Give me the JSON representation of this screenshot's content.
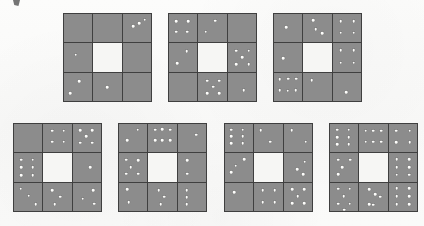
{
  "page": {
    "background_color": "#fbfbfa",
    "tile_color": "#8c8c8c",
    "grid_line_color": "#3f3f3f",
    "dot_color": "#fdfdfb",
    "center_color": "#f6f6f4",
    "artifact_label": "scan-mark"
  },
  "puzzle": {
    "type": "dot-pattern-matrix",
    "grid_count": 7,
    "grid_shape": "3x3",
    "center_cell": "blank"
  },
  "chart_data": {
    "type": "heatmap",
    "title": "",
    "xlabel": "",
    "ylabel": "",
    "categories": [
      "top-left",
      "top-middle",
      "top-right",
      "middle-left",
      "center",
      "middle-right",
      "bottom-left",
      "bottom-middle",
      "bottom-right"
    ],
    "series": [
      {
        "name": "grid-1",
        "values": [
          0,
          0,
          3,
          1,
          null,
          0,
          2,
          1,
          0
        ]
      },
      {
        "name": "grid-2",
        "values": [
          4,
          2,
          0,
          2,
          null,
          5,
          0,
          5,
          1
        ]
      },
      {
        "name": "grid-3",
        "values": [
          1,
          3,
          4,
          1,
          null,
          4,
          6,
          1,
          1
        ]
      },
      {
        "name": "grid-4",
        "values": [
          0,
          4,
          5,
          6,
          null,
          1,
          3,
          3,
          3
        ]
      },
      {
        "name": "grid-5",
        "values": [
          2,
          6,
          1,
          4,
          null,
          2,
          2,
          3,
          3
        ]
      },
      {
        "name": "grid-6",
        "values": [
          6,
          2,
          2,
          3,
          null,
          3,
          1,
          4,
          5
        ]
      },
      {
        "name": "grid-7",
        "values": [
          6,
          6,
          4,
          4,
          null,
          6,
          6,
          5,
          6
        ]
      }
    ]
  },
  "grids": [
    {
      "id": "grid-1",
      "x": 63,
      "y": 13,
      "size": 89,
      "cells": [
        {
          "name": "top-left",
          "dots": []
        },
        {
          "name": "top-middle",
          "dots": []
        },
        {
          "name": "top-right",
          "dots": [
            [
              78,
              20
            ],
            [
              58,
              32
            ],
            [
              38,
              44
            ]
          ]
        },
        {
          "name": "middle-left",
          "dots": [
            [
              42,
              40
            ]
          ]
        },
        {
          "name": "center",
          "dots": [],
          "blank": true
        },
        {
          "name": "middle-right",
          "dots": []
        },
        {
          "name": "bottom-left",
          "dots": [
            [
              54,
              30
            ],
            [
              22,
              72
            ]
          ]
        },
        {
          "name": "bottom-middle",
          "dots": [
            [
              48,
              52
            ]
          ]
        },
        {
          "name": "bottom-right",
          "dots": []
        }
      ]
    },
    {
      "id": "grid-2",
      "x": 168,
      "y": 13,
      "size": 89,
      "cells": [
        {
          "name": "top-left",
          "dots": [
            [
              26,
              26
            ],
            [
              68,
              26
            ],
            [
              26,
              62
            ],
            [
              64,
              62
            ]
          ]
        },
        {
          "name": "top-middle",
          "dots": [
            [
              60,
              24
            ],
            [
              26,
              62
            ]
          ]
        },
        {
          "name": "top-right",
          "dots": []
        },
        {
          "name": "middle-left",
          "dots": [
            [
              62,
              28
            ],
            [
              28,
              70
            ]
          ]
        },
        {
          "name": "center",
          "dots": [],
          "blank": true
        },
        {
          "name": "middle-right",
          "dots": [
            [
              30,
              26
            ],
            [
              74,
              26
            ],
            [
              52,
              50
            ],
            [
              30,
              74
            ],
            [
              74,
              74
            ]
          ]
        },
        {
          "name": "bottom-left",
          "dots": []
        },
        {
          "name": "bottom-middle",
          "dots": [
            [
              32,
              28
            ],
            [
              74,
              28
            ],
            [
              52,
              50
            ],
            [
              32,
              72
            ],
            [
              74,
              72
            ]
          ]
        },
        {
          "name": "bottom-right",
          "dots": [
            [
              56,
              62
            ]
          ]
        }
      ]
    },
    {
      "id": "grid-3",
      "x": 273,
      "y": 13,
      "size": 89,
      "cells": [
        {
          "name": "top-left",
          "dots": [
            [
              44,
              46
            ]
          ]
        },
        {
          "name": "top-middle",
          "dots": [
            [
              34,
              22
            ],
            [
              44,
              54
            ],
            [
              66,
              68
            ]
          ]
        },
        {
          "name": "top-right",
          "dots": [
            [
              28,
              26
            ],
            [
              74,
              26
            ],
            [
              28,
              66
            ],
            [
              74,
              66
            ]
          ]
        },
        {
          "name": "middle-left",
          "dots": [
            [
              32,
              52
            ]
          ]
        },
        {
          "name": "center",
          "dots": [],
          "blank": true
        },
        {
          "name": "middle-right",
          "dots": [
            [
              28,
              24
            ],
            [
              74,
              24
            ],
            [
              28,
              68
            ],
            [
              74,
              68
            ]
          ]
        },
        {
          "name": "bottom-left",
          "dots": [
            [
              20,
              24
            ],
            [
              50,
              22
            ],
            [
              78,
              22
            ],
            [
              20,
              62
            ],
            [
              48,
              64
            ],
            [
              76,
              62
            ]
          ]
        },
        {
          "name": "bottom-middle",
          "dots": [
            [
              30,
              26
            ]
          ]
        },
        {
          "name": "bottom-right",
          "dots": [
            [
              48,
              68
            ]
          ]
        }
      ]
    },
    {
      "id": "grid-4",
      "x": 13,
      "y": 123,
      "size": 89,
      "cells": [
        {
          "name": "top-left",
          "dots": []
        },
        {
          "name": "top-middle",
          "dots": [
            [
              32,
              24
            ],
            [
              72,
              24
            ],
            [
              32,
              62
            ],
            [
              72,
              62
            ]
          ]
        },
        {
          "name": "top-right",
          "dots": [
            [
              26,
              22
            ],
            [
              70,
              22
            ],
            [
              48,
              44
            ],
            [
              26,
              66
            ],
            [
              70,
              66
            ]
          ]
        },
        {
          "name": "middle-left",
          "dots": [
            [
              26,
              22
            ],
            [
              66,
              22
            ],
            [
              26,
              50
            ],
            [
              66,
              50
            ],
            [
              26,
              78
            ],
            [
              66,
              78
            ]
          ]
        },
        {
          "name": "center",
          "dots": [],
          "blank": true
        },
        {
          "name": "middle-right",
          "dots": [
            [
              62,
              48
            ]
          ]
        },
        {
          "name": "bottom-left",
          "dots": [
            [
              24,
              22
            ],
            [
              52,
              46
            ],
            [
              76,
              76
            ]
          ]
        },
        {
          "name": "bottom-middle",
          "dots": [
            [
              32,
              26
            ],
            [
              60,
              50
            ],
            [
              40,
              76
            ]
          ]
        },
        {
          "name": "bottom-right",
          "dots": [
            [
              72,
              26
            ],
            [
              36,
              56
            ],
            [
              76,
              74
            ]
          ]
        }
      ]
    },
    {
      "id": "grid-5",
      "x": 118,
      "y": 123,
      "size": 89,
      "cells": [
        {
          "name": "top-left",
          "dots": [
            [
              66,
              20
            ],
            [
              28,
              58
            ]
          ]
        },
        {
          "name": "top-middle",
          "dots": [
            [
              24,
              20
            ],
            [
              50,
              18
            ],
            [
              78,
              20
            ],
            [
              24,
              58
            ],
            [
              50,
              58
            ],
            [
              78,
              58
            ]
          ]
        },
        {
          "name": "top-right",
          "dots": [
            [
              66,
              38
            ]
          ]
        },
        {
          "name": "middle-left",
          "dots": [
            [
              26,
              22
            ],
            [
              68,
              24
            ],
            [
              42,
              48
            ],
            [
              26,
              72
            ],
            [
              68,
              72
            ]
          ]
        },
        {
          "name": "center",
          "dots": [],
          "blank": true
        },
        {
          "name": "middle-right",
          "dots": [
            [
              34,
              24
            ],
            [
              34,
              72
            ]
          ]
        },
        {
          "name": "bottom-left",
          "dots": [
            [
              28,
              24
            ],
            [
              34,
              70
            ]
          ]
        },
        {
          "name": "bottom-middle",
          "dots": [
            [
              36,
              26
            ],
            [
              56,
              50
            ],
            [
              44,
              76
            ]
          ]
        },
        {
          "name": "bottom-right",
          "dots": [
            [
              32,
              26
            ],
            [
              32,
              52
            ],
            [
              32,
              76
            ]
          ]
        }
      ]
    },
    {
      "id": "grid-6",
      "x": 224,
      "y": 123,
      "size": 89,
      "cells": [
        {
          "name": "top-left",
          "dots": [
            [
              22,
              20
            ],
            [
              62,
              20
            ],
            [
              22,
              44
            ],
            [
              62,
              44
            ],
            [
              22,
              68
            ],
            [
              62,
              68
            ]
          ]
        },
        {
          "name": "top-middle",
          "dots": [
            [
              22,
              22
            ],
            [
              56,
              62
            ]
          ]
        },
        {
          "name": "top-right",
          "dots": [
            [
              28,
              22
            ],
            [
              78,
              62
            ]
          ]
        },
        {
          "name": "middle-left",
          "dots": [
            [
              68,
              20
            ],
            [
              38,
              44
            ],
            [
              22,
              66
            ]
          ]
        },
        {
          "name": "center",
          "dots": [],
          "blank": true
        },
        {
          "name": "middle-right",
          "dots": [
            [
              74,
              30
            ],
            [
              48,
              56
            ],
            [
              68,
              74
            ]
          ]
        },
        {
          "name": "bottom-left",
          "dots": [
            [
              32,
              34
            ]
          ]
        },
        {
          "name": "bottom-middle",
          "dots": [
            [
              30,
              26
            ],
            [
              72,
              26
            ],
            [
              30,
              68
            ],
            [
              72,
              68
            ]
          ]
        },
        {
          "name": "bottom-right",
          "dots": [
            [
              30,
              24
            ],
            [
              72,
              24
            ],
            [
              50,
              48
            ],
            [
              30,
              72
            ],
            [
              72,
              72
            ]
          ]
        }
      ]
    },
    {
      "id": "grid-7",
      "x": 329,
      "y": 123,
      "size": 89,
      "cells": [
        {
          "name": "top-left",
          "dots": [
            [
              26,
              20
            ],
            [
              66,
              20
            ],
            [
              26,
              46
            ],
            [
              66,
              46
            ],
            [
              26,
              72
            ],
            [
              66,
              72
            ]
          ]
        },
        {
          "name": "top-middle",
          "dots": [
            [
              22,
              24
            ],
            [
              50,
              24
            ],
            [
              78,
              24
            ],
            [
              22,
              62
            ],
            [
              50,
              62
            ],
            [
              78,
              62
            ]
          ]
        },
        {
          "name": "top-right",
          "dots": [
            [
              26,
              24
            ],
            [
              74,
              24
            ],
            [
              26,
              64
            ],
            [
              74,
              64
            ]
          ]
        },
        {
          "name": "middle-left",
          "dots": [
            [
              30,
              22
            ],
            [
              72,
              22
            ],
            [
              44,
              50
            ],
            [
              30,
              74
            ]
          ]
        },
        {
          "name": "center",
          "dots": [],
          "blank": true
        },
        {
          "name": "middle-right",
          "dots": [
            [
              28,
              20
            ],
            [
              72,
              20
            ],
            [
              28,
              48
            ],
            [
              72,
              48
            ],
            [
              28,
              76
            ],
            [
              72,
              76
            ]
          ]
        },
        {
          "name": "bottom-left",
          "dots": [
            [
              28,
              22
            ],
            [
              70,
              22
            ],
            [
              48,
              48
            ],
            [
              28,
              74
            ],
            [
              70,
              74
            ],
            [
              50,
              96
            ]
          ]
        },
        {
          "name": "bottom-middle",
          "dots": [
            [
              34,
              24
            ],
            [
              74,
              50
            ],
            [
              34,
              76
            ],
            [
              56,
              40
            ],
            [
              48,
              78
            ]
          ]
        },
        {
          "name": "bottom-right",
          "dots": [
            [
              28,
              20
            ],
            [
              72,
              20
            ],
            [
              28,
              48
            ],
            [
              72,
              48
            ],
            [
              28,
              76
            ],
            [
              72,
              76
            ]
          ]
        }
      ]
    }
  ]
}
